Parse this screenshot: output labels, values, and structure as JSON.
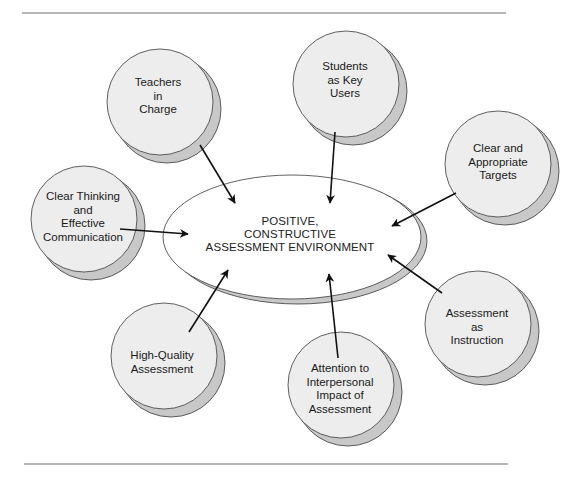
{
  "diagram": {
    "center": {
      "lines": [
        "POSITIVE,",
        "CONSTRUCTIVE",
        "ASSESSMENT ENVIRONMENT"
      ]
    },
    "nodes": [
      {
        "id": "teachers",
        "lines": [
          "Teachers",
          "in",
          "Charge"
        ]
      },
      {
        "id": "students",
        "lines": [
          "Students",
          "as Key",
          "Users"
        ]
      },
      {
        "id": "targets",
        "lines": [
          "Clear and",
          "Appropriate",
          "Targets"
        ]
      },
      {
        "id": "instruction",
        "lines": [
          "Assessment",
          "as",
          "Instruction"
        ]
      },
      {
        "id": "interpersonal",
        "lines": [
          "Attention to",
          "Interpersonal",
          "Impact of",
          "Assessment"
        ]
      },
      {
        "id": "quality",
        "lines": [
          "High-Quality",
          "Assessment"
        ]
      },
      {
        "id": "communication",
        "lines": [
          "Clear Thinking",
          "and",
          "Effective",
          "Communication"
        ]
      }
    ],
    "colors": {
      "circle_fill": "#ededed",
      "shadow_fill": "#c8c8c8",
      "ellipse_fill": "#ffffff",
      "outline": "#3a3a3a",
      "arrow": "#111111",
      "rule": "#b5b5b5"
    }
  }
}
